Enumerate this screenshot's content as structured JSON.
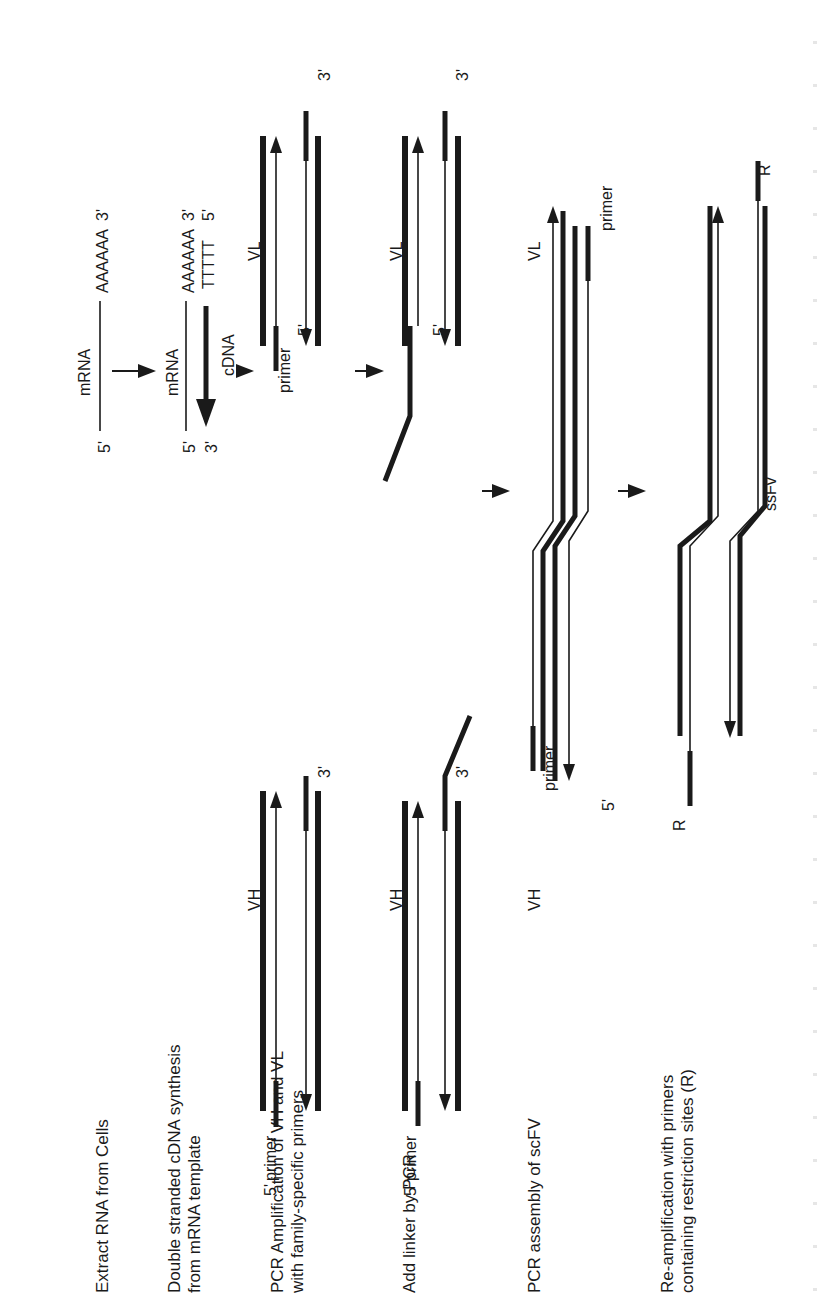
{
  "figure": {
    "orientation": "rotated-90-ccw",
    "steps": [
      {
        "id": "extract",
        "label": "Extract RNA from Cells"
      },
      {
        "id": "cdna",
        "label_line1": "Double stranded cDNA synthesis",
        "label_line2": "from mRNA template"
      },
      {
        "id": "pcr-amp",
        "label_line1": "PCR Amplification of VH and VL",
        "label_line2": "with family-specific primers"
      },
      {
        "id": "linker",
        "label": "Add linker by PCR"
      },
      {
        "id": "assembly",
        "label": "PCR assembly of scFV"
      },
      {
        "id": "reamp",
        "label_line1": "Re-amplification with primers",
        "label_line2": "containing restriction sites (R)"
      }
    ],
    "mrna": {
      "five_prime": "5'",
      "three_prime": "3'",
      "label": "mRNA",
      "polyA": "AAAAAA"
    },
    "cdna": {
      "five_prime_top": "5'",
      "three_prime_bottom": "3'",
      "mrna_label": "mRNA",
      "cdna_label": "cDNA",
      "polyA": "AAAAAA",
      "polyT": "TTTTT",
      "three_prime_top": "3'",
      "five_prime_bottom": "5'"
    },
    "pcr_amp": {
      "vh_label": "VH",
      "vl_label": "VL",
      "primer_label": "primer",
      "five_prime": "5'",
      "three_prime": "3'"
    },
    "linker_step": {
      "vh_label": "VH",
      "vl_label": "VL",
      "primer_label": "primer",
      "five_prime": "5'",
      "three_prime": "3'"
    },
    "assembly_step": {
      "vh_label": "VH",
      "vl_label": "VL",
      "primer_label": "primer",
      "five_prime": "5'"
    },
    "reamp_step": {
      "restriction_label": "R",
      "product_label": "ssFv"
    },
    "caption": ""
  }
}
